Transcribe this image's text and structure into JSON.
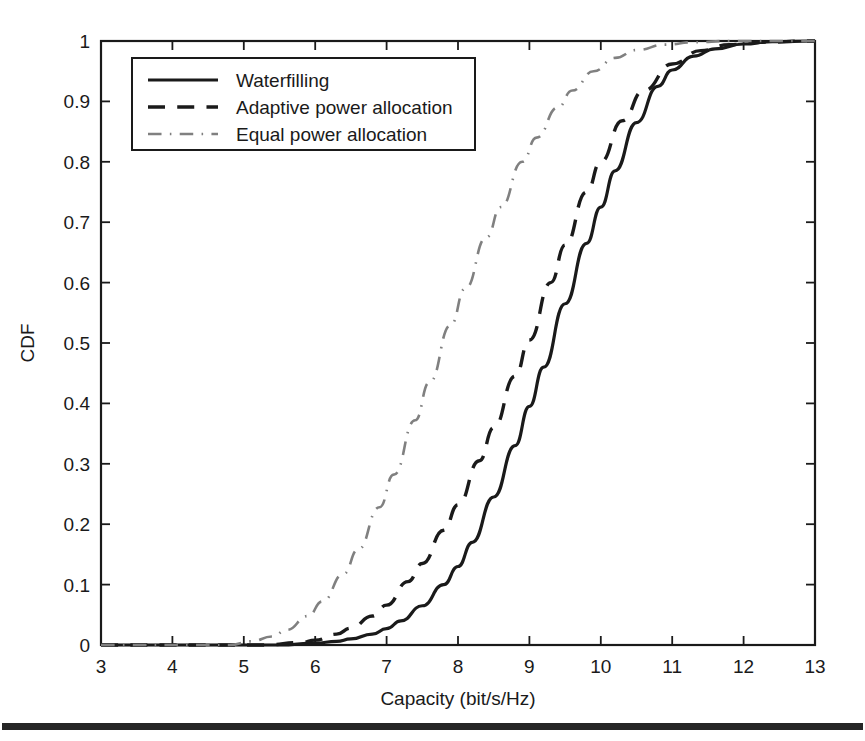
{
  "chart_data": {
    "type": "line",
    "title": "",
    "xlabel": "Capacity   (bit/s/Hz)",
    "ylabel": "CDF",
    "xlim": [
      3,
      13
    ],
    "ylim": [
      0,
      1
    ],
    "xticks": [
      "3",
      "4",
      "5",
      "6",
      "7",
      "8",
      "9",
      "10",
      "11",
      "12",
      "13"
    ],
    "yticks": [
      "0",
      "0.1",
      "0.2",
      "0.3",
      "0.4",
      "0.5",
      "0.6",
      "0.7",
      "0.8",
      "0.9",
      "1"
    ],
    "grid": false,
    "legend_position": "upper left",
    "series": [
      {
        "name": "Waterfilling",
        "style": "solid",
        "color": "#1a1a1a",
        "x": [
          3.0,
          5.5,
          6.0,
          6.3,
          6.5,
          6.8,
          7.0,
          7.2,
          7.5,
          7.8,
          8.0,
          8.2,
          8.5,
          8.8,
          9.0,
          9.2,
          9.5,
          9.8,
          10.0,
          10.2,
          10.5,
          10.8,
          11.0,
          11.3,
          11.6,
          12.0,
          12.4,
          13.0
        ],
        "y": [
          0.0,
          0.0,
          0.003,
          0.006,
          0.01,
          0.018,
          0.027,
          0.04,
          0.065,
          0.1,
          0.13,
          0.17,
          0.245,
          0.33,
          0.395,
          0.46,
          0.565,
          0.665,
          0.725,
          0.785,
          0.865,
          0.925,
          0.952,
          0.975,
          0.987,
          0.995,
          0.999,
          1.0
        ]
      },
      {
        "name": "Adaptive power allocation",
        "style": "dashed",
        "color": "#1a1a1a",
        "x": [
          3.0,
          5.3,
          5.8,
          6.0,
          6.3,
          6.5,
          6.8,
          7.0,
          7.3,
          7.5,
          7.8,
          8.0,
          8.3,
          8.5,
          8.8,
          9.0,
          9.3,
          9.5,
          9.8,
          10.0,
          10.3,
          10.6,
          11.0,
          11.4,
          11.8,
          12.2,
          13.0
        ],
        "y": [
          0.0,
          0.0,
          0.004,
          0.008,
          0.018,
          0.028,
          0.048,
          0.066,
          0.105,
          0.135,
          0.19,
          0.232,
          0.305,
          0.36,
          0.445,
          0.505,
          0.6,
          0.662,
          0.75,
          0.8,
          0.868,
          0.918,
          0.962,
          0.984,
          0.994,
          0.998,
          1.0
        ]
      },
      {
        "name": "Equal power allocation",
        "style": "dashdot",
        "color": "#808080",
        "x": [
          3.0,
          4.8,
          5.1,
          5.4,
          5.6,
          5.9,
          6.1,
          6.4,
          6.6,
          6.9,
          7.1,
          7.4,
          7.6,
          7.9,
          8.1,
          8.4,
          8.6,
          8.9,
          9.1,
          9.4,
          9.6,
          9.9,
          10.2,
          10.5,
          10.9,
          11.3,
          11.8,
          13.0
        ],
        "y": [
          0.0,
          0.0,
          0.006,
          0.014,
          0.025,
          0.048,
          0.072,
          0.118,
          0.158,
          0.228,
          0.282,
          0.372,
          0.435,
          0.53,
          0.59,
          0.675,
          0.725,
          0.8,
          0.84,
          0.89,
          0.918,
          0.95,
          0.972,
          0.985,
          0.994,
          0.998,
          1.0,
          1.0
        ]
      }
    ]
  },
  "legend": {
    "entries": [
      {
        "label": "Waterfilling"
      },
      {
        "label": "Adaptive power allocation"
      },
      {
        "label": "Equal power allocation"
      }
    ]
  },
  "footer": {
    "scan_bar": ""
  }
}
